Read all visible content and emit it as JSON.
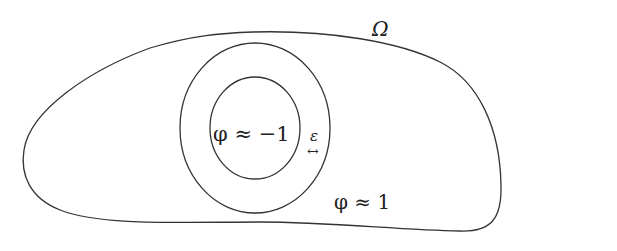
{
  "diagram": {
    "domain_label": "Ω",
    "inner_region_label": "φ ≈ −1",
    "outer_region_label": "φ ≈ 1",
    "interface_width_label": "ε",
    "interface_width_arrow": "↔"
  }
}
